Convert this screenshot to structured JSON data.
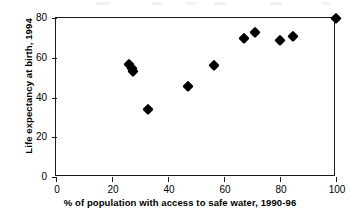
{
  "chart_data": {
    "type": "scatter",
    "title": "",
    "xlabel": "% of population with access to safe water, 1990-96",
    "ylabel": "Life expectancy at birth, 1994",
    "xlim": [
      0,
      100
    ],
    "ylim": [
      0,
      80
    ],
    "xticks": [
      0,
      20,
      40,
      60,
      80,
      100
    ],
    "yticks": [
      0,
      20,
      40,
      60,
      80
    ],
    "grid": false,
    "legend": null,
    "marker": "filled-diamond",
    "marker_color": "#000000",
    "points": [
      {
        "x": 26.0,
        "y": 57.0
      },
      {
        "x": 27.0,
        "y": 55.0
      },
      {
        "x": 27.5,
        "y": 53.5
      },
      {
        "x": 33.0,
        "y": 34.0
      },
      {
        "x": 47.0,
        "y": 46.0
      },
      {
        "x": 56.5,
        "y": 56.5
      },
      {
        "x": 67.0,
        "y": 70.0
      },
      {
        "x": 71.0,
        "y": 73.0
      },
      {
        "x": 80.0,
        "y": 69.0
      },
      {
        "x": 84.5,
        "y": 71.0
      },
      {
        "x": 100.0,
        "y": 80.0
      }
    ]
  },
  "axes": {
    "y": {
      "title": "Life expectancy at birth, 1994",
      "tick_labels": [
        "0",
        "20",
        "40",
        "60",
        "80"
      ]
    },
    "x": {
      "title": "% of population with access to safe water, 1990-96",
      "tick_labels": [
        "0",
        "20",
        "40",
        "60",
        "80",
        "100"
      ]
    }
  },
  "style": {
    "axis_color": "#1a1a1a",
    "marker_color": "#000000",
    "background": "#ffffff"
  }
}
